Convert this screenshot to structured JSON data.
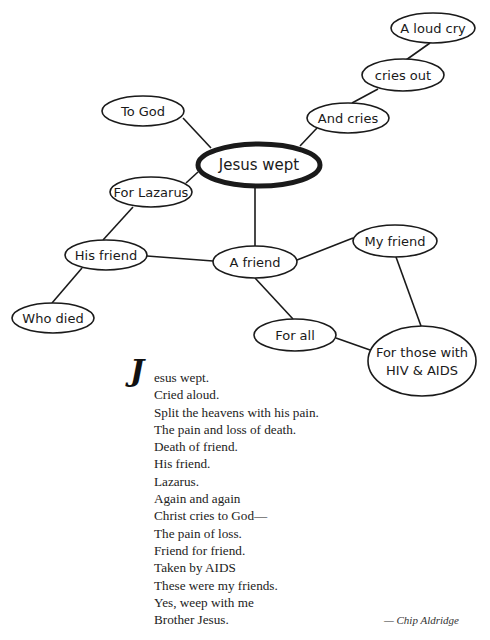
{
  "diagram": {
    "type": "word-web",
    "central_node": {
      "id": "jesus_wept",
      "label": "Jesus wept",
      "cx": 259,
      "cy": 165,
      "rx": 61,
      "ry": 21
    },
    "nodes": [
      {
        "id": "a_loud_cry",
        "label": "A loud cry",
        "cx": 433,
        "cy": 28,
        "rx": 42,
        "ry": 15
      },
      {
        "id": "cries_out",
        "label": "cries out",
        "cx": 403,
        "cy": 75,
        "rx": 41,
        "ry": 16
      },
      {
        "id": "and_cries",
        "label": "And cries",
        "cx": 348,
        "cy": 118,
        "rx": 41,
        "ry": 15
      },
      {
        "id": "to_god",
        "label": "To God",
        "cx": 143,
        "cy": 111,
        "rx": 41,
        "ry": 15
      },
      {
        "id": "for_lazarus",
        "label": "For Lazarus",
        "cx": 151,
        "cy": 192,
        "rx": 41,
        "ry": 15
      },
      {
        "id": "his_friend",
        "label": "His friend",
        "cx": 106,
        "cy": 255,
        "rx": 41,
        "ry": 15
      },
      {
        "id": "who_died",
        "label": "Who died",
        "cx": 53,
        "cy": 318,
        "rx": 41,
        "ry": 15
      },
      {
        "id": "a_friend",
        "label": "A friend",
        "cx": 255,
        "cy": 262,
        "rx": 42,
        "ry": 16
      },
      {
        "id": "my_friend",
        "label": "My friend",
        "cx": 395,
        "cy": 241,
        "rx": 42,
        "ry": 16
      },
      {
        "id": "for_all",
        "label": "For all",
        "cx": 295,
        "cy": 335,
        "rx": 41,
        "ry": 16
      },
      {
        "id": "for_those_with_hiv_aids",
        "label_lines": [
          "For those with",
          "HIV & AIDS"
        ],
        "cx": 422,
        "cy": 361,
        "rx": 54,
        "ry": 35
      }
    ],
    "edges": [
      {
        "from": "jesus_wept",
        "to": "to_god",
        "x1": 211,
        "y1": 148,
        "x2": 183,
        "y2": 118
      },
      {
        "from": "jesus_wept",
        "to": "and_cries",
        "x1": 300,
        "y1": 146,
        "x2": 317,
        "y2": 128
      },
      {
        "from": "and_cries",
        "to": "cries_out",
        "x1": 352,
        "y1": 103,
        "x2": 378,
        "y2": 89
      },
      {
        "from": "cries_out",
        "to": "a_loud_cry",
        "x1": 406,
        "y1": 60,
        "x2": 430,
        "y2": 43
      },
      {
        "from": "jesus_wept",
        "to": "for_lazarus",
        "x1": 198,
        "y1": 172,
        "x2": 186,
        "y2": 183
      },
      {
        "from": "for_lazarus",
        "to": "his_friend",
        "x1": 133,
        "y1": 207,
        "x2": 103,
        "y2": 240
      },
      {
        "from": "his_friend",
        "to": "who_died",
        "x1": 82,
        "y1": 268,
        "x2": 52,
        "y2": 303
      },
      {
        "from": "jesus_wept",
        "to": "a_friend",
        "x1": 255,
        "y1": 186,
        "x2": 255,
        "y2": 246
      },
      {
        "from": "his_friend",
        "to": "a_friend",
        "x1": 147,
        "y1": 256,
        "x2": 213,
        "y2": 261
      },
      {
        "from": "a_friend",
        "to": "my_friend",
        "x1": 297,
        "y1": 260,
        "x2": 353,
        "y2": 238
      },
      {
        "from": "a_friend",
        "to": "for_all",
        "x1": 255,
        "y1": 278,
        "x2": 293,
        "y2": 319
      },
      {
        "from": "my_friend",
        "to": "for_those_with_hiv_aids",
        "x1": 396,
        "y1": 257,
        "x2": 421,
        "y2": 326
      },
      {
        "from": "for_all",
        "to": "for_those_with_hiv_aids",
        "x1": 336,
        "y1": 338,
        "x2": 370,
        "y2": 350
      }
    ]
  },
  "poem": {
    "drop_cap": "J",
    "first_line_rest": "esus wept.",
    "lines": [
      "Cried aloud.",
      "Split the heavens with his pain.",
      "The pain and loss of death.",
      "Death of friend.",
      "His friend.",
      "Lazarus.",
      "Again and again",
      "Christ cries to God—",
      "The pain of loss.",
      "Friend for friend.",
      "Taken by AIDS",
      "These were my friends.",
      "Yes, weep with me",
      "Brother Jesus."
    ],
    "attribution": "— Chip Aldridge"
  }
}
